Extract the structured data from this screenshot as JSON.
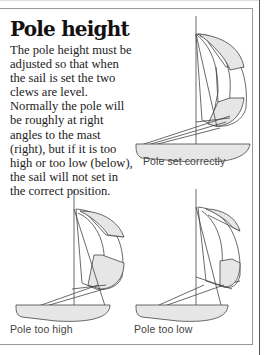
{
  "section": {
    "title": "Pole height",
    "body": "The pole height must be adjusted so that when the sail is set the two clews are level. Normally the pole will be roughly at right angles to the mast (right), but if it is too high or too low (below), the sail will not set in the correct position."
  },
  "figures": [
    {
      "id": "correct",
      "caption": "Pole set correctly"
    },
    {
      "id": "high",
      "caption": "Pole too high"
    },
    {
      "id": "low",
      "caption": "Pole too low"
    }
  ],
  "colors": {
    "line": "#444444",
    "fill": "#e6e6e6",
    "border": "#9a9a9a"
  }
}
